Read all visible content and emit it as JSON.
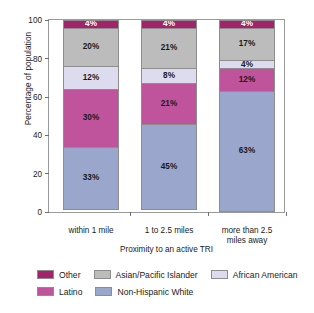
{
  "chart_data": {
    "type": "bar",
    "subtype": "stacked-bar-100",
    "title": "",
    "xlabel": "Proximity to an active TRI",
    "ylabel": "Percentage of population",
    "categories": [
      "within 1 mile",
      "1 to 2.5 miles",
      "more than 2.5 miles away"
    ],
    "ylim": [
      0,
      100
    ],
    "yticks": [
      0,
      20,
      40,
      60,
      80,
      100
    ],
    "grid": false,
    "legend_position": "bottom",
    "series": [
      {
        "name": "Non-Hispanic White",
        "color": "#9ba6cc",
        "values": [
          33,
          45,
          63
        ]
      },
      {
        "name": "Latino",
        "color": "#c0549c",
        "values": [
          30,
          21,
          12
        ]
      },
      {
        "name": "African American",
        "color": "#dcdcee",
        "values": [
          12,
          8,
          4
        ]
      },
      {
        "name": "Asian/Pacific Islander",
        "color": "#bcbcbc",
        "values": [
          20,
          21,
          17
        ]
      },
      {
        "name": "Other",
        "color": "#a4216b",
        "values": [
          4,
          4,
          4
        ]
      }
    ],
    "value_labels": [
      [
        "33%",
        "30%",
        "12%",
        "20%",
        "4%"
      ],
      [
        "45%",
        "21%",
        "8%",
        "21%",
        "4%"
      ],
      [
        "63%",
        "12%",
        "4%",
        "17%",
        "4%"
      ]
    ]
  },
  "axes": {
    "y_title": "Percentage of population",
    "x_title": "Proximity to an active TRI",
    "y_ticks": [
      "100",
      "80",
      "60",
      "40",
      "20",
      "0"
    ],
    "x_categories": [
      {
        "line1": "within 1 mile",
        "line2": ""
      },
      {
        "line1": "1 to 2.5 miles",
        "line2": ""
      },
      {
        "line1": "more than 2.5",
        "line2": "miles away"
      }
    ]
  },
  "legend": {
    "row1": [
      {
        "label": "Other",
        "color": "#a4216b"
      },
      {
        "label": "Asian/Pacific Islander",
        "color": "#bcbcbc"
      },
      {
        "label": "African American",
        "color": "#dcdcee"
      }
    ],
    "row2": [
      {
        "label": "Latino",
        "color": "#c0549c"
      },
      {
        "label": "Non-Hispanic White",
        "color": "#9ba6cc"
      }
    ]
  }
}
